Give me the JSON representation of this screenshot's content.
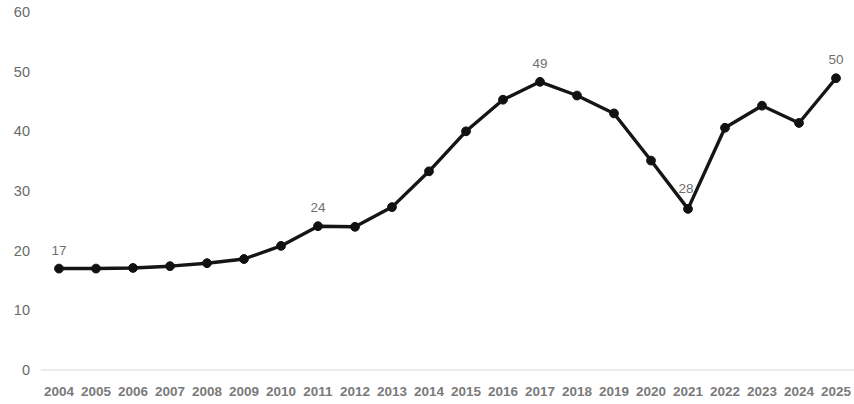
{
  "chart_data": {
    "type": "line",
    "title": "",
    "subtitle": "",
    "xlabel": "",
    "ylabel": "",
    "grid": false,
    "legend": false,
    "legend_position": "none",
    "line_color": "#151515",
    "marker_color": "#111111",
    "axis_color": "#d8d8d8",
    "tick_label_color": "#7a7a7a",
    "data_label_color": "#6f6f6f",
    "xlim": [
      2004,
      2025
    ],
    "ylim": [
      0,
      60
    ],
    "ytick_labels": [
      "60",
      "50",
      "40",
      "30",
      "20",
      "10",
      "0"
    ],
    "ytick_values": [
      60,
      50,
      40,
      30,
      20,
      10,
      0
    ],
    "categories": [
      "2004",
      "2005",
      "2006",
      "2007",
      "2008",
      "2009",
      "2010",
      "2011",
      "2012",
      "2013",
      "2014",
      "2015",
      "2016",
      "2017",
      "2018",
      "2019",
      "2020",
      "2021",
      "2022",
      "2023",
      "2024",
      "2025"
    ],
    "values": [
      17.0,
      17.0,
      17.1,
      17.4,
      17.9,
      18.6,
      20.8,
      24.1,
      24.0,
      27.3,
      33.3,
      40.0,
      45.3,
      48.3,
      46.0,
      43.0,
      35.1,
      27.0,
      40.6,
      44.3,
      41.4,
      48.9
    ],
    "data_labels": [
      {
        "category": "2004",
        "value": 17.0,
        "text": "17"
      },
      {
        "category": "2011",
        "value": 24.1,
        "text": "24"
      },
      {
        "category": "2017",
        "value": 48.3,
        "text": "49"
      },
      {
        "category": "2021",
        "value": 27.0,
        "text": "28"
      },
      {
        "category": "2025",
        "value": 48.9,
        "text": "50"
      }
    ]
  }
}
